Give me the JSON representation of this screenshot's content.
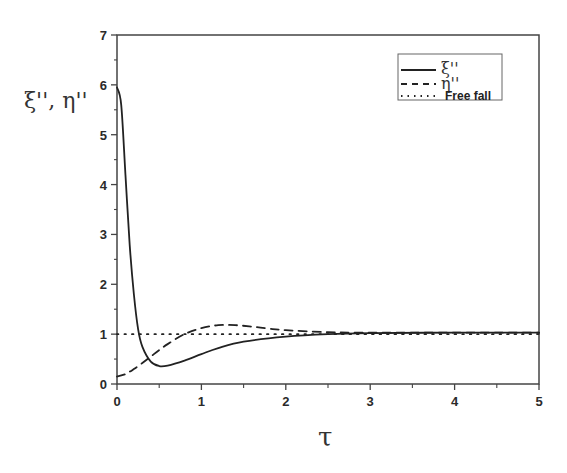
{
  "chart_data": {
    "type": "line",
    "title": "",
    "xlabel": "τ",
    "ylabel": "ξ'', η''",
    "xlim": [
      0,
      5
    ],
    "ylim": [
      0,
      7
    ],
    "x_ticks": [
      "0",
      "1",
      "2",
      "3",
      "4",
      "5"
    ],
    "y_ticks": [
      "0",
      "1",
      "2",
      "3",
      "4",
      "5",
      "6",
      "7"
    ],
    "grid": false,
    "legend_position": "upper right",
    "series": [
      {
        "name": "ξ''",
        "style": "solid",
        "x": [
          0,
          0.05,
          0.1,
          0.15,
          0.2,
          0.25,
          0.3,
          0.4,
          0.5,
          0.6,
          0.8,
          1.0,
          1.2,
          1.5,
          2.0,
          2.5,
          3.0,
          4.0,
          5.0
        ],
        "y": [
          5.95,
          5.6,
          4.2,
          2.8,
          1.8,
          1.1,
          0.75,
          0.45,
          0.36,
          0.37,
          0.47,
          0.6,
          0.72,
          0.85,
          0.95,
          1.0,
          1.02,
          1.03,
          1.03
        ]
      },
      {
        "name": "η''",
        "style": "dashed",
        "x": [
          0,
          0.1,
          0.2,
          0.3,
          0.4,
          0.5,
          0.6,
          0.8,
          1.0,
          1.2,
          1.4,
          1.6,
          1.8,
          2.0,
          2.5,
          3.0,
          4.0,
          5.0
        ],
        "y": [
          0.15,
          0.2,
          0.3,
          0.42,
          0.55,
          0.68,
          0.8,
          1.0,
          1.12,
          1.18,
          1.18,
          1.15,
          1.11,
          1.08,
          1.04,
          1.03,
          1.03,
          1.03
        ]
      },
      {
        "name": "Free fall",
        "style": "dotted",
        "x": [
          0,
          5
        ],
        "y": [
          1,
          1
        ]
      }
    ]
  },
  "labels": {
    "ylabel": "ξ'', η''",
    "xlabel": "τ",
    "legend": [
      "ξ''",
      "η''",
      "Free fall"
    ]
  }
}
